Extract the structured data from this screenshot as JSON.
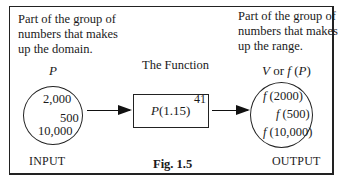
{
  "figure": {
    "caption": "Fig. 1.5",
    "domain_description": [
      "Part of the group of",
      "numbers that makes",
      "up the domain."
    ],
    "range_description": [
      "Part of the group of",
      "numbers that makes",
      "up the range."
    ],
    "input": {
      "variable": "P",
      "values": [
        "2,000",
        "500",
        "10,000"
      ],
      "label": "INPUT"
    },
    "function": {
      "title": "The Function",
      "expression_base": "P(1.15)",
      "expression_exponent": "41"
    },
    "output": {
      "variable_prefix": "V or ",
      "variable_func": "f (P)",
      "values": [
        "f (2000)",
        "f (500)",
        "f (10,000)"
      ],
      "label": "OUTPUT"
    }
  }
}
